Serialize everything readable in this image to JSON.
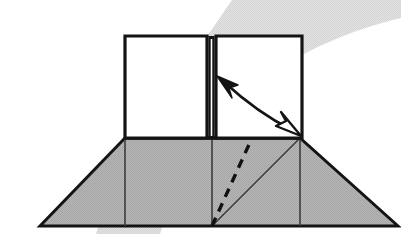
{
  "figure": {
    "domain_note": "scanned line-art geometry illustration",
    "width": 401,
    "height": 234,
    "background_color": "#ffffff"
  },
  "colors": {
    "ink": "#1a1a1a",
    "stroke": "#141414",
    "base_fill": "#b2b2b2",
    "base_fill_light": "#bdbdbd",
    "panel_fill": "#ffffff",
    "backdrop_band": "#d9d9d9",
    "backdrop_band_soft": "#e6e6e6",
    "dash_color": "#111111",
    "thin_rule": "#3c3c3c"
  },
  "backdrop": {
    "name": "curved-gray-band",
    "description": "soft light-gray halftone band sweeping from upper right down to lower left behind the figure",
    "path": "M 232 0 L 401 0 L 401 18 C 350 30 300 52 262 80 C 220 112 185 160 160 234 L 96 234 C 120 150 160 84 205 38 C 214 28 223 12 232 0 Z",
    "opacity": 0.9
  },
  "base": {
    "name": "trapezoid-base",
    "description": "shaded trapezoid representing the flat ground / unfolded sheet",
    "fill": "#b2b2b2",
    "points": "40,226 125,138 300,138 398,226",
    "top_left": [
      125,
      138
    ],
    "top_right": [
      300,
      138
    ],
    "bottom_left": [
      40,
      226
    ],
    "bottom_right": [
      398,
      226
    ]
  },
  "base_creases": [
    {
      "name": "crease-left-vertical",
      "type": "solid",
      "from": [
        125,
        138
      ],
      "to": [
        125,
        226
      ]
    },
    {
      "name": "crease-center-vertical",
      "type": "solid",
      "from": [
        212,
        138
      ],
      "to": [
        212,
        226
      ]
    },
    {
      "name": "crease-right-vertical",
      "type": "solid",
      "from": [
        300,
        138
      ],
      "to": [
        300,
        226
      ]
    },
    {
      "name": "crease-diagonal-solid",
      "type": "solid",
      "from": [
        212,
        226
      ],
      "to": [
        300,
        138
      ]
    }
  ],
  "fold_line": {
    "name": "dashed-fold-line",
    "type": "dashed",
    "from": [
      212,
      226
    ],
    "to": [
      252,
      138
    ],
    "dash_pattern": "9 7",
    "stroke_width": 3.2,
    "description": "dashed crease indicating the line along which the panel folds"
  },
  "panels": [
    {
      "name": "panel-left",
      "fill": "#ffffff",
      "points": "125,36 207,36 207,138 125,138",
      "x": 125,
      "y": 36,
      "width": 82,
      "height": 102
    },
    {
      "name": "panel-right",
      "fill": "#ffffff",
      "points": "216,36 302,36 302,138 216,138",
      "x": 216,
      "y": 36,
      "width": 86,
      "height": 102
    }
  ],
  "panel_divider": {
    "name": "panel-divider-spine",
    "description": "thick vertical double line where the two upright panels meet",
    "x_left": 207,
    "x_right": 216,
    "top": 36,
    "bottom": 138
  },
  "motion_arrow": {
    "name": "double-headed-fold-arrow",
    "description": "curved double-headed arrow showing the panel swinging between the raised and lowered positions",
    "curve": "M 224 82 C 248 104 272 120 292 130",
    "stroke_width": 2.6,
    "head_solid": {
      "name": "arrowhead-solid",
      "description": "filled black arrowhead at the upper-left end",
      "points": "217,76 238,85 229,88 232,98"
    },
    "head_hollow": {
      "name": "arrowhead-hollow",
      "description": "open/outlined arrowhead at the lower-right end",
      "points": "301,136 276,126 286,121 281,112"
    }
  },
  "labels": {
    "figure_caption": "",
    "notes": ""
  }
}
